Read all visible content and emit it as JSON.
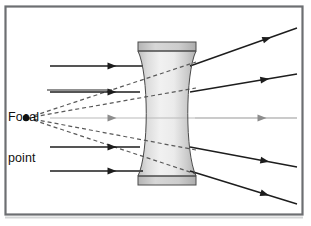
{
  "figure": {
    "background_color": "#ffffff",
    "width": 311,
    "height": 226
  },
  "frame": {
    "name": "figure-border",
    "x": 5.5,
    "y": 6.5,
    "width": 297,
    "height": 208,
    "stroke": "#6d6f72",
    "stroke_width": 2.2,
    "fill": "none"
  },
  "bottom_shadow": {
    "x": 5,
    "y": 216.5,
    "width": 298,
    "height": 2,
    "color": "#cfd1d3"
  },
  "labels": {
    "focal_point": {
      "line1": "Focal",
      "line2": "point",
      "color": "#111111",
      "font_size_px": 12.5
    }
  },
  "focal_point": {
    "name": "focal-point-dot",
    "x": 26,
    "y": 118,
    "radius": 3.2,
    "color": "#111111"
  },
  "leader_line": {
    "name": "focal-label-leader",
    "x1": 47,
    "y1": 90,
    "x2": 112,
    "y2": 90,
    "stroke": "#222222",
    "stroke_width": 1.1
  },
  "lens": {
    "name": "concave-lens",
    "type": "biconcave-diverging",
    "center_x": 167,
    "top_y": 42,
    "bottom_y": 185,
    "outer_half_width": 29,
    "waist_half_width": 17,
    "outline_stroke": "#4a4a4a",
    "outline_width": 1.0,
    "fill_light": "#f4f4f4",
    "fill_mid": "#d8d8d8",
    "fill_dark": "#b6b6b6",
    "cap_fill": "#c9c9c9",
    "cap_height": 9
  },
  "optical_axis": {
    "name": "optical-axis",
    "y": 118,
    "x_start": 50,
    "x_end": 297,
    "stroke": "#b9b9b9",
    "stroke_width": 1.0
  },
  "incoming_rays": {
    "name": "incoming-parallel-rays",
    "count": 5,
    "x_start": 50,
    "arrow_x": 112,
    "stroke": "#1d1d1d",
    "stroke_width": 1.4,
    "rays": [
      {
        "y": 66,
        "x_end": 143,
        "color": "#1d1d1d"
      },
      {
        "y": 92,
        "x_end": 140,
        "color": "#1d1d1d"
      },
      {
        "y": 118,
        "x_end": 297,
        "color": "#b9b9b9"
      },
      {
        "y": 147,
        "x_end": 140,
        "color": "#1d1d1d"
      },
      {
        "y": 171,
        "x_end": 143,
        "color": "#1d1d1d"
      }
    ]
  },
  "outgoing_rays": {
    "name": "diverging-output-rays",
    "count": 4,
    "stroke": "#1d1d1d",
    "stroke_width": 1.4,
    "rays": [
      {
        "x1": 190,
        "y1": 66,
        "x2": 297,
        "y2": 28,
        "arrow_t": 0.72
      },
      {
        "x1": 190,
        "y1": 92,
        "x2": 297,
        "y2": 74,
        "arrow_t": 0.7
      },
      {
        "x1": 190,
        "y1": 147,
        "x2": 297,
        "y2": 167,
        "arrow_t": 0.7
      },
      {
        "x1": 190,
        "y1": 171,
        "x2": 297,
        "y2": 204,
        "arrow_t": 0.7
      }
    ],
    "axis_ray": {
      "x1": 195,
      "y1": 118,
      "x2": 297,
      "y2": 118,
      "arrow_x": 262,
      "color": "#b9b9b9"
    }
  },
  "virtual_rays": {
    "name": "virtual-ray-extensions",
    "description": "Dashed backward extensions converging on the focal point",
    "count": 4,
    "stroke": "#595959",
    "stroke_width": 1.2,
    "dash": "4 3",
    "origin_x": 27,
    "origin_y": 118,
    "rays": [
      {
        "x_end": 196,
        "y_end": 62
      },
      {
        "x_end": 196,
        "y_end": 88
      },
      {
        "x_end": 196,
        "y_end": 150
      },
      {
        "x_end": 196,
        "y_end": 174
      }
    ]
  },
  "arrowhead": {
    "name": "ray-direction-arrowhead",
    "length": 9,
    "half_width": 3.4,
    "color": "#1d1d1d"
  },
  "chart_data": {
    "type": "diagram",
    "elements": [
      "incoming parallel light rays",
      "biconcave diverging lens",
      "outgoing diverging rays",
      "dashed virtual rays",
      "focal point"
    ],
    "annotations": [
      "Focal point"
    ]
  }
}
